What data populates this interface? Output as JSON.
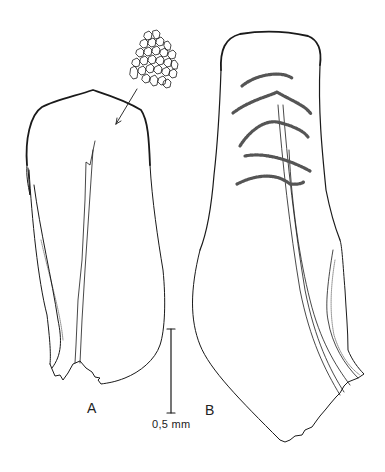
{
  "figure": {
    "panel_a_label": "A",
    "panel_b_label": "B",
    "scale_bar_label": "0,5 mm",
    "line_color": "#1a1a1a",
    "hatch_color": "#555555"
  }
}
